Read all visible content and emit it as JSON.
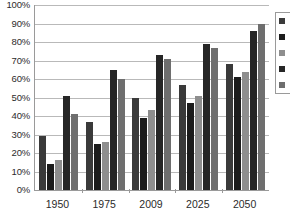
{
  "chart_data": {
    "type": "bar",
    "title": "",
    "subtitle": "",
    "xlabel": "",
    "ylabel": "",
    "categories": [
      "1950",
      "1975",
      "2009",
      "2025",
      "2050"
    ],
    "ylim": [
      0,
      100
    ],
    "y_unit": "%",
    "y_ticks": [
      "0%",
      "10%",
      "20%",
      "30%",
      "40%",
      "50%",
      "60%",
      "70%",
      "80%",
      "90%",
      "100%"
    ],
    "y_tick_values": [
      0,
      10,
      20,
      30,
      40,
      50,
      60,
      70,
      80,
      90,
      100
    ],
    "grid": true,
    "legend_position": "right",
    "series": [
      {
        "name": "series-1",
        "label": "",
        "color": "#3a3a3a",
        "values": [
          29,
          37,
          50,
          57,
          68
        ]
      },
      {
        "name": "series-2",
        "label": "",
        "color": "#1c1c1c",
        "values": [
          14,
          25,
          39,
          47,
          61
        ]
      },
      {
        "name": "series-3",
        "label": "",
        "color": "#8e8e8e",
        "values": [
          16,
          26,
          43,
          51,
          64
        ]
      },
      {
        "name": "series-4",
        "label": "",
        "color": "#262626",
        "values": [
          51,
          65,
          73,
          79,
          86
        ]
      },
      {
        "name": "series-5",
        "label": "",
        "color": "#6e6e6e",
        "values": [
          41,
          60,
          71,
          77,
          90
        ]
      }
    ]
  },
  "legend": {
    "items": [
      {
        "label": "",
        "color": "#3a3a3a"
      },
      {
        "label": "",
        "color": "#1c1c1c"
      },
      {
        "label": "",
        "color": "#8e8e8e"
      },
      {
        "label": "",
        "color": "#262626"
      },
      {
        "label": "",
        "color": "#6e6e6e"
      }
    ]
  }
}
